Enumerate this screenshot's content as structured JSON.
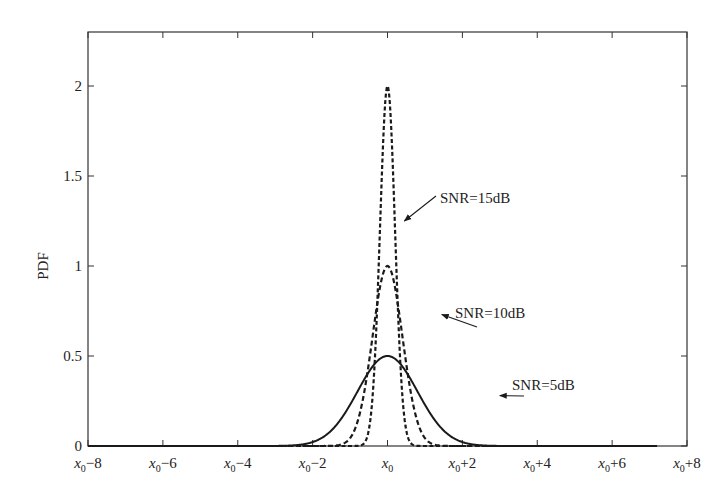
{
  "chart_data": {
    "type": "line",
    "title": "",
    "xlabel": "",
    "ylabel": "PDF",
    "xlim": [
      -8,
      8
    ],
    "ylim": [
      0,
      2.3
    ],
    "grid": false,
    "x_center_symbol": "x0",
    "x_ticks": [
      -8,
      -6,
      -4,
      -2,
      0,
      2,
      4,
      6,
      8
    ],
    "x_tick_labels": [
      "x0−8",
      "x0−6",
      "x0−4",
      "x0−2",
      "x0",
      "x0+2",
      "x0+4",
      "x0+6",
      "x0+8"
    ],
    "y_ticks": [
      0,
      0.5,
      1,
      1.5,
      2
    ],
    "y_tick_labels": [
      "0",
      "0.5",
      "1",
      "1.5",
      "2"
    ],
    "legend": "none (inline annotations with arrows)",
    "x_range_plotted": [
      -8,
      7.2
    ],
    "series": [
      {
        "name": "SNR=5dB",
        "style": "solid",
        "distribution": "gaussian",
        "mean": 0,
        "sigma": 0.8,
        "peak": 0.5,
        "x": [
          -8,
          -6,
          -4,
          -3,
          -2,
          -1,
          0,
          1,
          2,
          3,
          4,
          6,
          7.2
        ],
        "y": [
          0.0,
          0.0,
          0.002,
          0.04,
          0.22,
          0.36,
          0.5,
          0.36,
          0.22,
          0.04,
          0.002,
          0.0,
          0.0
        ]
      },
      {
        "name": "SNR=10dB",
        "style": "dash-dot",
        "distribution": "gaussian",
        "mean": 0,
        "sigma": 0.4,
        "peak": 1.0,
        "x": [
          -8,
          -4,
          -2,
          -1.5,
          -1,
          -0.5,
          0,
          0.5,
          1,
          1.5,
          2,
          4,
          7.2
        ],
        "y": [
          0.0,
          0.0,
          0.0,
          0.06,
          0.44,
          0.46,
          1.0,
          0.46,
          0.44,
          0.06,
          0.0,
          0.0,
          0.0
        ]
      },
      {
        "name": "SNR=15dB",
        "style": "dashed",
        "distribution": "gaussian",
        "mean": 0,
        "sigma": 0.2,
        "peak": 2.0,
        "x": [
          -8,
          -2,
          -1,
          -0.5,
          -0.25,
          0,
          0.25,
          0.5,
          1,
          2,
          7.2
        ],
        "y": [
          0.0,
          0.0,
          0.0,
          0.09,
          0.92,
          2.0,
          0.92,
          0.09,
          0.0,
          0.0,
          0.0
        ]
      }
    ],
    "annotations": [
      {
        "text": "SNR=15dB",
        "arrow_to_x": 0.45,
        "arrow_to_y": 1.25
      },
      {
        "text": "SNR=10dB",
        "arrow_to_x": 1.45,
        "arrow_to_y": 0.73
      },
      {
        "text": "SNR=5dB",
        "arrow_to_x": 3.0,
        "arrow_to_y": 0.28
      }
    ]
  },
  "labels": {
    "ylabel": "PDF",
    "annot_15": "SNR=15dB",
    "annot_10": "SNR=10dB",
    "annot_5": "SNR=5dB"
  },
  "colors": {
    "line": "#1a1a1a",
    "axis": "#333333",
    "background": "#ffffff"
  }
}
